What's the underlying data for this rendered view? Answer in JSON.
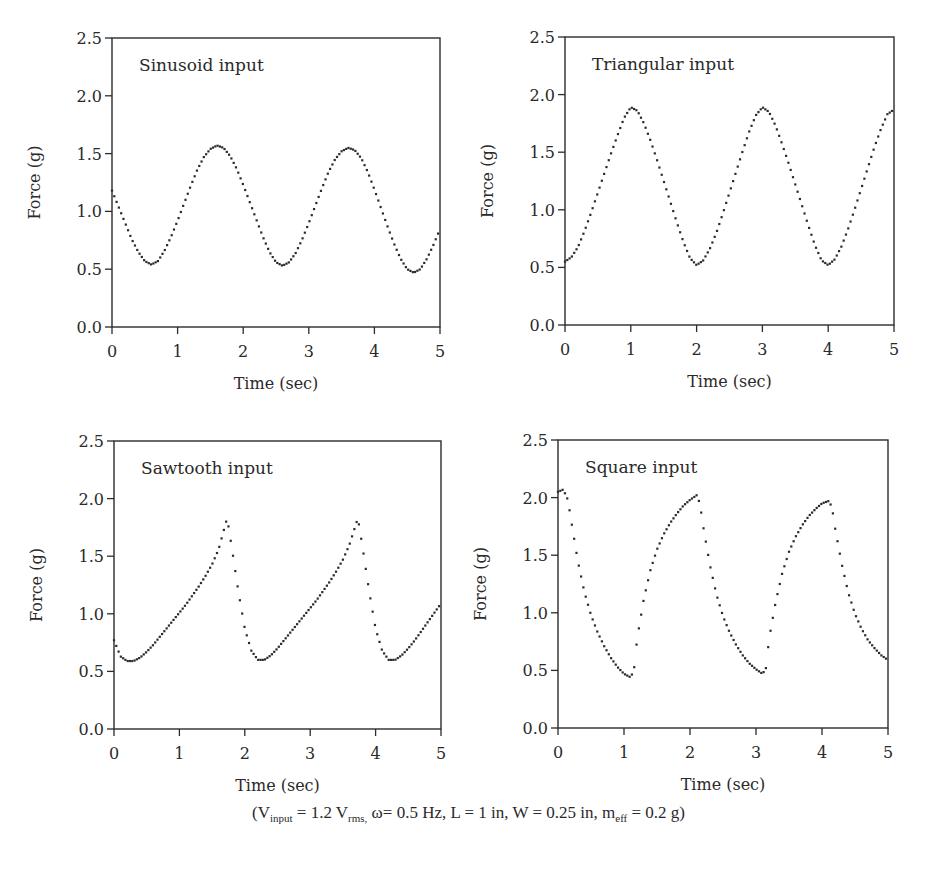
{
  "figure": {
    "caption": {
      "parts": [
        {
          "text": "(V",
          "sub": "input"
        },
        {
          "text": " = 1.2 V",
          "sub": "rms,"
        },
        {
          "text": " ω= 0.5 Hz, L = 1 in, W = 0.25 in, m",
          "sub": "eff"
        },
        {
          "text": " = 0.2 g)",
          "sub": ""
        }
      ]
    }
  },
  "chart_data": [
    {
      "type": "scatter",
      "title": "Sinusoid input",
      "xlabel": "Time (sec)",
      "ylabel": "Force (g)",
      "xlim": [
        0,
        5
      ],
      "ylim": [
        0,
        2.5
      ],
      "xticks": [
        "0",
        "1",
        "2",
        "3",
        "4",
        "5"
      ],
      "yticks": [
        "0.0",
        "0.5",
        "1.0",
        "1.5",
        "2.0",
        "2.5"
      ],
      "grid": false,
      "marker": "dotted",
      "plot_box": {
        "left": 112,
        "top": 38,
        "right": 440,
        "bottom": 327
      },
      "x": [
        0,
        0.1,
        0.2,
        0.3,
        0.4,
        0.5,
        0.6,
        0.7,
        0.8,
        0.9,
        1.0,
        1.1,
        1.2,
        1.3,
        1.4,
        1.5,
        1.6,
        1.7,
        1.8,
        1.9,
        2.0,
        2.1,
        2.2,
        2.3,
        2.4,
        2.5,
        2.6,
        2.7,
        2.8,
        2.9,
        3.0,
        3.1,
        3.2,
        3.3,
        3.4,
        3.5,
        3.6,
        3.7,
        3.8,
        3.9,
        4.0,
        4.1,
        4.2,
        4.3,
        4.4,
        4.5,
        4.6,
        4.7,
        4.8,
        4.9,
        5.0
      ],
      "y": [
        1.18,
        1.04,
        0.9,
        0.76,
        0.65,
        0.57,
        0.54,
        0.57,
        0.66,
        0.78,
        0.92,
        1.07,
        1.22,
        1.36,
        1.47,
        1.54,
        1.57,
        1.55,
        1.48,
        1.37,
        1.23,
        1.08,
        0.93,
        0.78,
        0.65,
        0.56,
        0.53,
        0.56,
        0.64,
        0.76,
        0.9,
        1.05,
        1.2,
        1.34,
        1.45,
        1.52,
        1.55,
        1.53,
        1.46,
        1.34,
        1.19,
        1.03,
        0.87,
        0.72,
        0.59,
        0.5,
        0.47,
        0.5,
        0.59,
        0.71,
        0.85
      ]
    },
    {
      "type": "scatter",
      "title": "Triangular input",
      "xlabel": "Time (sec)",
      "ylabel": "Force (g)",
      "xlim": [
        0,
        5
      ],
      "ylim": [
        0,
        2.5
      ],
      "xticks": [
        "0",
        "1",
        "2",
        "3",
        "4",
        "5"
      ],
      "yticks": [
        "0.0",
        "0.5",
        "1.0",
        "1.5",
        "2.0",
        "2.5"
      ],
      "grid": false,
      "marker": "dotted",
      "plot_box": {
        "left": 565,
        "top": 37,
        "right": 894,
        "bottom": 325
      },
      "x": [
        0,
        0.1,
        0.2,
        0.3,
        0.4,
        0.5,
        0.6,
        0.7,
        0.8,
        0.9,
        1.0,
        1.1,
        1.2,
        1.3,
        1.4,
        1.5,
        1.6,
        1.7,
        1.8,
        1.9,
        2.0,
        2.1,
        2.2,
        2.3,
        2.4,
        2.5,
        2.6,
        2.7,
        2.8,
        2.9,
        3.0,
        3.1,
        3.2,
        3.3,
        3.4,
        3.5,
        3.6,
        3.7,
        3.8,
        3.9,
        4.0,
        4.1,
        4.2,
        4.3,
        4.4,
        4.5,
        4.6,
        4.7,
        4.8,
        4.9,
        5.0
      ],
      "y": [
        0.55,
        0.59,
        0.68,
        0.82,
        0.98,
        1.15,
        1.32,
        1.49,
        1.65,
        1.8,
        1.89,
        1.86,
        1.75,
        1.6,
        1.43,
        1.25,
        1.07,
        0.89,
        0.72,
        0.58,
        0.52,
        0.56,
        0.66,
        0.8,
        0.97,
        1.15,
        1.33,
        1.51,
        1.68,
        1.82,
        1.89,
        1.85,
        1.73,
        1.57,
        1.4,
        1.22,
        1.04,
        0.86,
        0.69,
        0.56,
        0.52,
        0.57,
        0.68,
        0.83,
        1.0,
        1.18,
        1.36,
        1.54,
        1.7,
        1.83,
        1.87
      ]
    },
    {
      "type": "scatter",
      "title": "Sawtooth input",
      "xlabel": "Time (sec)",
      "ylabel": "Force (g)",
      "xlim": [
        0,
        5
      ],
      "ylim": [
        0,
        2.5
      ],
      "xticks": [
        "0",
        "1",
        "2",
        "3",
        "4",
        "5"
      ],
      "yticks": [
        "0.0",
        "0.5",
        "1.0",
        "1.5",
        "2.0",
        "2.5"
      ],
      "grid": false,
      "marker": "dotted",
      "plot_box": {
        "left": 114,
        "top": 441,
        "right": 441,
        "bottom": 729
      },
      "x": [
        0,
        0.1,
        0.2,
        0.3,
        0.4,
        0.5,
        0.6,
        0.7,
        0.8,
        0.9,
        1.0,
        1.1,
        1.2,
        1.3,
        1.4,
        1.5,
        1.6,
        1.7,
        1.73,
        1.8,
        1.9,
        2.0,
        2.1,
        2.2,
        2.3,
        2.4,
        2.5,
        2.6,
        2.7,
        2.8,
        2.9,
        3.0,
        3.1,
        3.2,
        3.3,
        3.4,
        3.5,
        3.6,
        3.7,
        3.73,
        3.8,
        3.9,
        4.0,
        4.1,
        4.2,
        4.3,
        4.4,
        4.5,
        4.6,
        4.7,
        4.8,
        4.9,
        5.0
      ],
      "y": [
        0.77,
        0.63,
        0.59,
        0.59,
        0.62,
        0.67,
        0.73,
        0.8,
        0.87,
        0.94,
        1.01,
        1.08,
        1.16,
        1.24,
        1.33,
        1.43,
        1.56,
        1.77,
        1.83,
        1.58,
        1.2,
        0.87,
        0.68,
        0.6,
        0.6,
        0.64,
        0.7,
        0.77,
        0.84,
        0.91,
        0.98,
        1.05,
        1.12,
        1.2,
        1.28,
        1.37,
        1.47,
        1.6,
        1.78,
        1.83,
        1.58,
        1.2,
        0.87,
        0.68,
        0.6,
        0.6,
        0.64,
        0.7,
        0.77,
        0.85,
        0.93,
        1.01,
        1.09
      ]
    },
    {
      "type": "scatter",
      "title": "Square input",
      "xlabel": "Time (sec)",
      "ylabel": "Force (g)",
      "xlim": [
        0,
        5
      ],
      "ylim": [
        0,
        2.5
      ],
      "xticks": [
        "0",
        "1",
        "2",
        "3",
        "4",
        "5"
      ],
      "yticks": [
        "0.0",
        "0.5",
        "1.0",
        "1.5",
        "2.0",
        "2.5"
      ],
      "grid": false,
      "marker": "dotted",
      "plot_box": {
        "left": 558,
        "top": 440,
        "right": 888,
        "bottom": 728
      },
      "x": [
        0,
        0.08,
        0.15,
        0.2,
        0.3,
        0.4,
        0.5,
        0.6,
        0.7,
        0.8,
        0.9,
        1.0,
        1.1,
        1.15,
        1.2,
        1.3,
        1.4,
        1.5,
        1.6,
        1.7,
        1.8,
        1.9,
        2.0,
        2.1,
        2.15,
        2.2,
        2.3,
        2.4,
        2.5,
        2.6,
        2.7,
        2.8,
        2.9,
        3.0,
        3.1,
        3.15,
        3.2,
        3.3,
        3.4,
        3.5,
        3.6,
        3.7,
        3.8,
        3.9,
        4.0,
        4.1,
        4.15,
        4.2,
        4.3,
        4.4,
        4.5,
        4.6,
        4.7,
        4.8,
        4.9,
        5.0
      ],
      "y": [
        2.05,
        2.07,
        1.98,
        1.8,
        1.45,
        1.18,
        0.98,
        0.83,
        0.71,
        0.61,
        0.53,
        0.47,
        0.44,
        0.5,
        0.78,
        1.12,
        1.37,
        1.55,
        1.68,
        1.78,
        1.86,
        1.93,
        1.98,
        2.02,
        1.95,
        1.75,
        1.42,
        1.16,
        0.97,
        0.83,
        0.72,
        0.63,
        0.56,
        0.51,
        0.47,
        0.52,
        0.78,
        1.1,
        1.35,
        1.53,
        1.66,
        1.76,
        1.84,
        1.9,
        1.95,
        1.97,
        1.92,
        1.73,
        1.42,
        1.17,
        0.99,
        0.86,
        0.76,
        0.69,
        0.63,
        0.59
      ]
    }
  ]
}
